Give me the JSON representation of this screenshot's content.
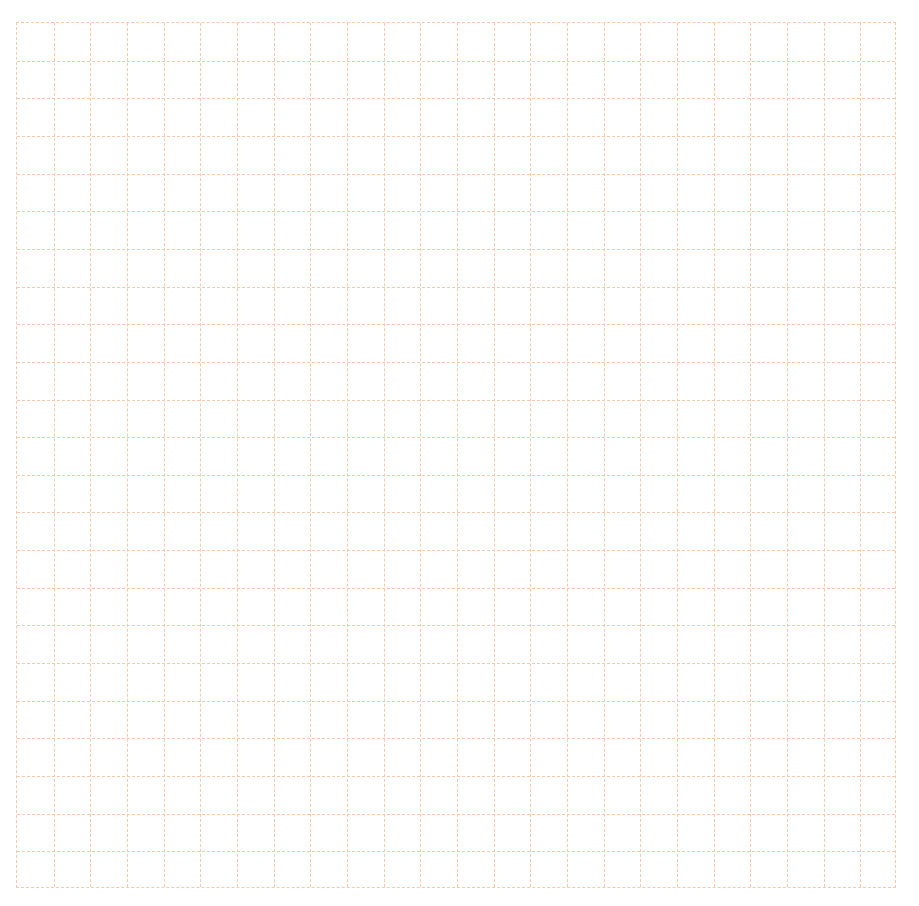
{
  "page": {
    "title": "　　　　　　　　　　　　",
    "title_note": "heading clipped at top edge; glyphs unreadable",
    "title_color": "#c8703a"
  },
  "grid": {
    "columns": 24,
    "rows": 23,
    "line_color": "#f4c9ac",
    "line_style": "dashed"
  }
}
